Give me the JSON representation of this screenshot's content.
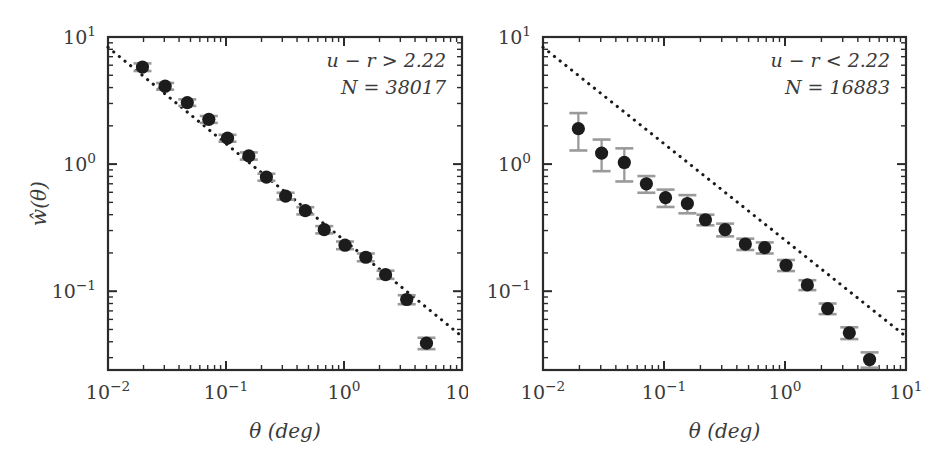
{
  "figure": {
    "background_color": "#ffffff",
    "marker_color": "#1c1c1c",
    "errorbar_color": "#9a9a9a",
    "line_color": "#1a1a1a",
    "axis_color": "#2b2b2b"
  },
  "axes": {
    "x_title": "θ (deg)",
    "y_title": "ŵ(θ)",
    "x_tick_labels": [
      "10⁻²",
      "10⁻¹",
      "10⁰",
      "10¹"
    ],
    "y_tick_labels": [
      "10¹",
      "10⁰",
      "10⁻¹"
    ],
    "x_tick_values": [
      -2,
      -1,
      0,
      1
    ],
    "y_tick_values": [
      1,
      0,
      -1
    ],
    "xlim": [
      -2,
      1
    ],
    "ylim": [
      -1.62,
      1.0
    ],
    "xscale": "log",
    "yscale": "log",
    "grid": false
  },
  "chart_data": [
    {
      "type": "scatter",
      "panel": "left",
      "title": "",
      "xlabel": "θ (deg)",
      "ylabel": "ŵ(θ)",
      "xscale": "log",
      "yscale": "log",
      "xlim": [
        0.01,
        10
      ],
      "ylim": [
        0.024,
        10
      ],
      "grid": false,
      "annotations": [
        {
          "text": "u − r > 2.22",
          "position": "top-right"
        },
        {
          "text": "N = 38017",
          "position": "top-right"
        }
      ],
      "series": [
        {
          "name": "w(theta) red galaxies",
          "marker": "filled-circle",
          "x": [
            0.0196,
            0.0305,
            0.047,
            0.0715,
            0.103,
            0.156,
            0.22,
            0.32,
            0.47,
            0.68,
            1.02,
            1.53,
            2.25,
            3.4,
            5.0
          ],
          "y": [
            5.8,
            4.1,
            3.05,
            2.25,
            1.6,
            1.16,
            0.79,
            0.56,
            0.43,
            0.305,
            0.23,
            0.185,
            0.135,
            0.086,
            0.039
          ],
          "yerr": [
            0.4,
            0.25,
            0.18,
            0.14,
            0.1,
            0.075,
            0.05,
            0.035,
            0.028,
            0.02,
            0.016,
            0.013,
            0.01,
            0.007,
            0.004
          ]
        }
      ],
      "reference_line": {
        "name": "power-law reference",
        "style": "dotted",
        "x": [
          0.01,
          10
        ],
        "y": [
          8.3,
          0.044
        ]
      }
    },
    {
      "type": "scatter",
      "panel": "right",
      "title": "",
      "xlabel": "θ (deg)",
      "ylabel": "ŵ(θ)",
      "xscale": "log",
      "yscale": "log",
      "xlim": [
        0.01,
        10
      ],
      "ylim": [
        0.024,
        10
      ],
      "grid": false,
      "annotations": [
        {
          "text": "u − r < 2.22",
          "position": "top-right"
        },
        {
          "text": "N = 16883",
          "position": "top-right"
        }
      ],
      "series": [
        {
          "name": "w(theta) blue galaxies",
          "marker": "filled-circle",
          "x": [
            0.0196,
            0.0305,
            0.047,
            0.0715,
            0.103,
            0.156,
            0.22,
            0.32,
            0.47,
            0.68,
            1.02,
            1.53,
            2.25,
            3.4,
            5.0
          ],
          "y": [
            1.9,
            1.22,
            1.03,
            0.7,
            0.545,
            0.49,
            0.365,
            0.305,
            0.235,
            0.22,
            0.16,
            0.112,
            0.073,
            0.047,
            0.029
          ],
          "yerr": [
            0.62,
            0.34,
            0.3,
            0.105,
            0.085,
            0.08,
            0.035,
            0.035,
            0.024,
            0.022,
            0.016,
            0.01,
            0.007,
            0.005,
            0.004
          ]
        }
      ],
      "reference_line": {
        "name": "power-law reference",
        "style": "dotted",
        "x": [
          0.01,
          10
        ],
        "y": [
          8.3,
          0.044
        ]
      }
    }
  ]
}
